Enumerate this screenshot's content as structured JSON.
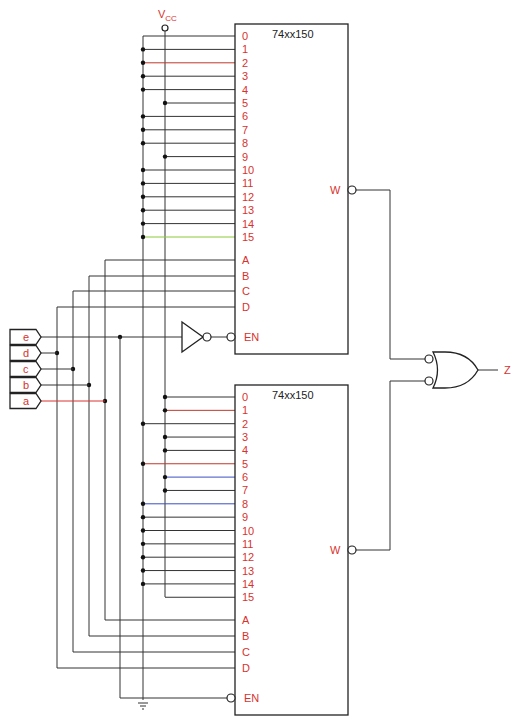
{
  "supply_label": "V",
  "supply_subscript": "CC",
  "output_label": "Z",
  "inputs": [
    "e",
    "d",
    "c",
    "b",
    "a"
  ],
  "chips": [
    {
      "part": "74xx150",
      "data_pins": [
        "0",
        "1",
        "2",
        "3",
        "4",
        "5",
        "6",
        "7",
        "8",
        "9",
        "10",
        "11",
        "12",
        "13",
        "14",
        "15"
      ],
      "select_pins": [
        "A",
        "B",
        "C",
        "D"
      ],
      "enable_pin": "EN",
      "output_pin": "W",
      "pin_ties": [
        "GND",
        "GND",
        "GND",
        "GND",
        "GND",
        "VCC",
        "GND",
        "GND",
        "GND",
        "VCC",
        "GND",
        "GND",
        "GND",
        "GND",
        "GND",
        "GND"
      ]
    },
    {
      "part": "74xx150",
      "data_pins": [
        "0",
        "1",
        "2",
        "3",
        "4",
        "5",
        "6",
        "7",
        "8",
        "9",
        "10",
        "11",
        "12",
        "13",
        "14",
        "15"
      ],
      "select_pins": [
        "A",
        "B",
        "C",
        "D"
      ],
      "enable_pin": "EN",
      "output_pin": "W",
      "pin_ties": [
        "VCC",
        "VCC",
        "GND",
        "VCC",
        "VCC",
        "GND",
        "VCC",
        "VCC",
        "GND",
        "GND",
        "GND",
        "GND",
        "GND",
        "GND",
        "GND",
        "VCC"
      ]
    }
  ],
  "connections": {
    "select": {
      "A": "a",
      "B": "b",
      "C": "c",
      "D": "d"
    },
    "upper_enable": "e (through inverter)",
    "lower_enable": "e",
    "or_gate_inputs": [
      "upper W",
      "lower W"
    ],
    "or_gate_output": "Z"
  },
  "wire_colors": {
    "upper_pin2": "#c0392b",
    "upper_pin15": "#8aca3a",
    "lower_pin1": "#c0392b",
    "lower_pin5": "#c0392b",
    "lower_pin6": "#3b4fc4",
    "lower_pin8": "#3b4fc4",
    "input_a": "#d8322e"
  }
}
